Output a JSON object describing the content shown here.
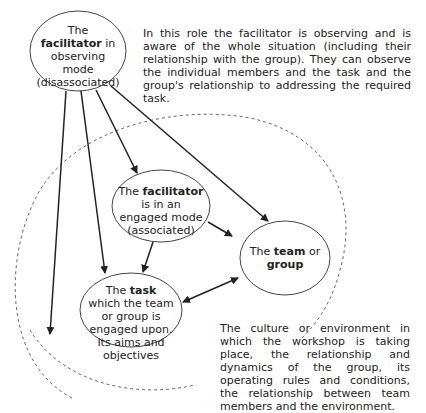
{
  "nodes": {
    "observer": {
      "pre": "The ",
      "bold": "facilitator",
      "post": " in observing mode (disassociated)"
    },
    "engaged": {
      "pre": "The ",
      "bold": "facilitator",
      "post": " is in an engaged mode (associated)"
    },
    "team": {
      "pre": "The ",
      "bold": "team",
      "mid": " or ",
      "bold2": "group"
    },
    "task": {
      "pre": "The ",
      "bold": "task",
      "post": " which the team or group is engaged upon.  Its aims and objectives"
    }
  },
  "notes": {
    "observer_note": "In this role the facilitator is observing and is aware of the whole situation (including their relationship with the group). They can observe the individual members and the task and the group's relationship to addressing the required task.",
    "environment_note": "The culture or environment in which the workshop is taking place, the relationship and dynamics of the group, its operating rules and conditions, the relationship between team members and the environment."
  },
  "colors": {
    "line": "#222222",
    "dashed": "#666666"
  }
}
